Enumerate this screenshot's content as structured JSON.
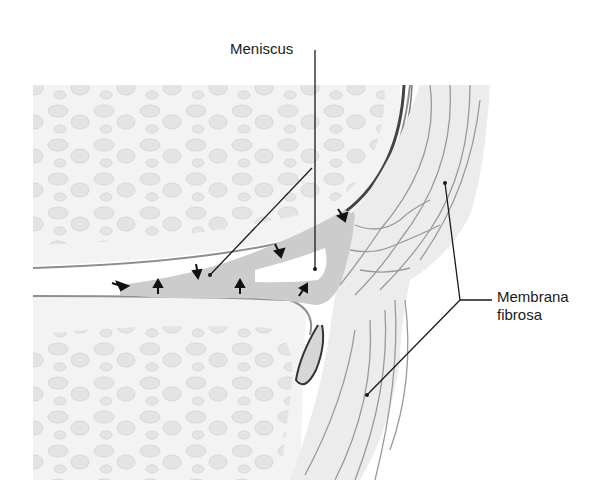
{
  "labels": {
    "meniscus": "Meniscus",
    "membrana_fibrosa_line1": "Membrana",
    "membrana_fibrosa_line2": "fibrosa"
  },
  "colors": {
    "background": "#ffffff",
    "bone_fill": "#f2f2f2",
    "trabecula": "#e2e2e2",
    "cartilage": "#eeeeee",
    "capsule_fill": "#ececec",
    "meniscus_fill": "#cccccc",
    "fiber_line": "#9a9a9a",
    "leader_line": "#1a1a1a",
    "arrow": "#111111"
  },
  "arrows": [
    {
      "x": 125,
      "y": 285,
      "angle": 20
    },
    {
      "x": 158,
      "y": 290,
      "angle": -90
    },
    {
      "x": 196,
      "y": 268,
      "angle": 80
    },
    {
      "x": 240,
      "y": 290,
      "angle": -90
    },
    {
      "x": 278,
      "y": 249,
      "angle": 60
    },
    {
      "x": 302,
      "y": 293,
      "angle": -60
    },
    {
      "x": 341,
      "y": 214,
      "angle": 55
    }
  ]
}
